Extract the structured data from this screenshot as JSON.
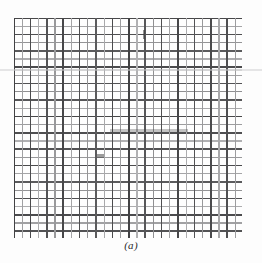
{
  "figure": {
    "caption": "(a)",
    "kind": "woven-wire-mesh-micrograph",
    "background_color": "#fdfdfd",
    "ink_color": "#3a3a3a",
    "plate": {
      "left_px": 14,
      "top_px": 18,
      "width_px": 228,
      "height_px": 220
    }
  },
  "chart_data": {
    "type": "heatmap",
    "title": "(a)",
    "subtitle": "",
    "xlabel": "",
    "ylabel": "",
    "grid": true,
    "legend_position": "none",
    "columns": 28,
    "rows": 27,
    "spacing_px": 8.2,
    "x_origin_px": 0,
    "y_origin_px": 0,
    "line_width_px": 1.35,
    "xlim": [
      0,
      228
    ],
    "ylim": [
      0,
      220
    ],
    "vertical_line_darkness": [
      0.92,
      0.46,
      0.88,
      0.4,
      0.84,
      0.5,
      0.9,
      0.44,
      0.86,
      0.52,
      0.8,
      0.42,
      0.88,
      0.48,
      0.92,
      0.38,
      0.82,
      0.54,
      0.86,
      0.44,
      0.9,
      0.4,
      0.84,
      0.5,
      0.88,
      0.42,
      0.86,
      0.48,
      0.9
    ],
    "horizontal_line_darkness": [
      0.9,
      0.44,
      0.86,
      0.52,
      0.8,
      0.4,
      0.88,
      0.46,
      0.84,
      0.54,
      0.82,
      0.42,
      0.9,
      0.48,
      0.86,
      0.38,
      0.84,
      0.5,
      0.88,
      0.44,
      0.8,
      0.52,
      0.86,
      0.4,
      0.88,
      0.46,
      0.84,
      0.92
    ],
    "artifacts": [
      {
        "name": "dark-horizontal-streak",
        "x_px": 96,
        "y_px": 111,
        "width_px": 78,
        "height_px": 3,
        "opacity": 0.3
      },
      {
        "name": "ink-tick-upper-mid",
        "x_px": 129,
        "y_px": 12,
        "width_px": 2,
        "height_px": 9,
        "opacity": 0.55
      },
      {
        "name": "ink-mark-left-lower",
        "x_px": 83,
        "y_px": 136,
        "width_px": 7,
        "height_px": 4,
        "opacity": 0.5
      },
      {
        "name": "faint-scan-band",
        "x_px": 0,
        "y_px": 51,
        "width_px": 228,
        "height_px": 2,
        "opacity": 0.2
      }
    ]
  }
}
